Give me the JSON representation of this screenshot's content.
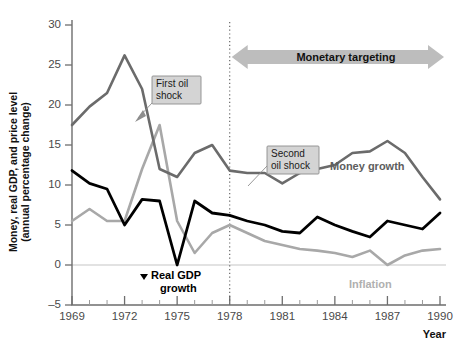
{
  "chart_data": {
    "type": "line",
    "title": "",
    "xlabel": "Year",
    "ylabel": "Money, real GDP, and price level (annual percentage change)",
    "xlim": [
      1969,
      1990
    ],
    "ylim": [
      -5,
      30
    ],
    "yticks": [
      -5,
      0,
      5,
      10,
      15,
      20,
      25,
      30
    ],
    "xticks": [
      1969,
      1972,
      1975,
      1978,
      1981,
      1984,
      1987,
      1990
    ],
    "grid": false,
    "legend_position": "inline-labels",
    "x": [
      1969,
      1970,
      1971,
      1972,
      1973,
      1974,
      1975,
      1976,
      1977,
      1978,
      1979,
      1980,
      1981,
      1982,
      1983,
      1984,
      1985,
      1986,
      1987,
      1988,
      1989,
      1990
    ],
    "series": [
      {
        "name": "Money growth",
        "color": "#6b6b6b",
        "values": [
          17.5,
          19.8,
          21.5,
          26.2,
          22.0,
          12.0,
          11.0,
          14.0,
          15.0,
          11.8,
          11.5,
          11.5,
          10.2,
          11.5,
          12.0,
          12.5,
          14.0,
          14.2,
          15.5,
          14.0,
          11.0,
          8.2
        ]
      },
      {
        "name": "Real GDP growth",
        "color": "#000000",
        "values": [
          11.8,
          10.2,
          9.5,
          5.0,
          8.2,
          8.0,
          0.0,
          8.0,
          6.5,
          6.2,
          5.5,
          5.0,
          4.2,
          4.0,
          6.0,
          5.0,
          4.2,
          3.5,
          5.5,
          5.0,
          4.5,
          6.5
        ]
      },
      {
        "name": "Inflation",
        "color": "#a8a8a8",
        "values": [
          5.5,
          7.0,
          5.5,
          5.5,
          12.0,
          17.5,
          5.5,
          1.5,
          4.0,
          5.0,
          4.0,
          3.0,
          2.5,
          2.0,
          1.8,
          1.5,
          1.0,
          1.8,
          0.0,
          1.2,
          1.8,
          2.0
        ]
      }
    ],
    "annotations": [
      {
        "name": "first-oil-shock",
        "text_lines": [
          "First oil",
          "shock"
        ],
        "at_x": 1974,
        "at_y": 17.5
      },
      {
        "name": "second-oil-shock",
        "text_lines": [
          "Second",
          "oil shock"
        ],
        "at_x": 1979,
        "at_y": 11.5
      },
      {
        "name": "monetary-targeting-band",
        "text": "Monetary targeting",
        "from_x": 1978,
        "to_x": 1990
      },
      {
        "name": "divider-1978",
        "at_x": 1978
      }
    ],
    "series_labels": [
      {
        "name": "money-growth-label",
        "text": "Money growth"
      },
      {
        "name": "real-gdp-growth-label",
        "text_lines": [
          "Real GDP",
          "growth"
        ]
      },
      {
        "name": "inflation-label",
        "text": "Inflation"
      }
    ]
  },
  "axes": {
    "y_title_line1": "Money, real GDP, and price level",
    "y_title_line2": "(annual percentage change)",
    "x_title": "Year",
    "y_tick_labels": [
      "30",
      "25",
      "20",
      "15",
      "10",
      "5",
      "0",
      "–5"
    ],
    "x_tick_labels": [
      "1969",
      "1972",
      "1975",
      "1978",
      "1981",
      "1984",
      "1987",
      "1990"
    ]
  },
  "labels": {
    "first_oil_shock_l1": "First oil",
    "first_oil_shock_l2": "shock",
    "second_oil_shock_l1": "Second",
    "second_oil_shock_l2": "oil shock",
    "monetary_targeting": "Monetary targeting",
    "money_growth": "Money growth",
    "real_gdp_growth_l1": "Real GDP",
    "real_gdp_growth_l2": "growth",
    "inflation": "Inflation"
  },
  "colors": {
    "money_growth": "#6b6b6b",
    "real_gdp_growth": "#000000",
    "inflation": "#a8a8a8",
    "callout_bg": "#d4d4d4",
    "band_arrow": "#bdbdbd",
    "axis": "#6e6e6e",
    "zero_line": "#d8d8d8"
  }
}
